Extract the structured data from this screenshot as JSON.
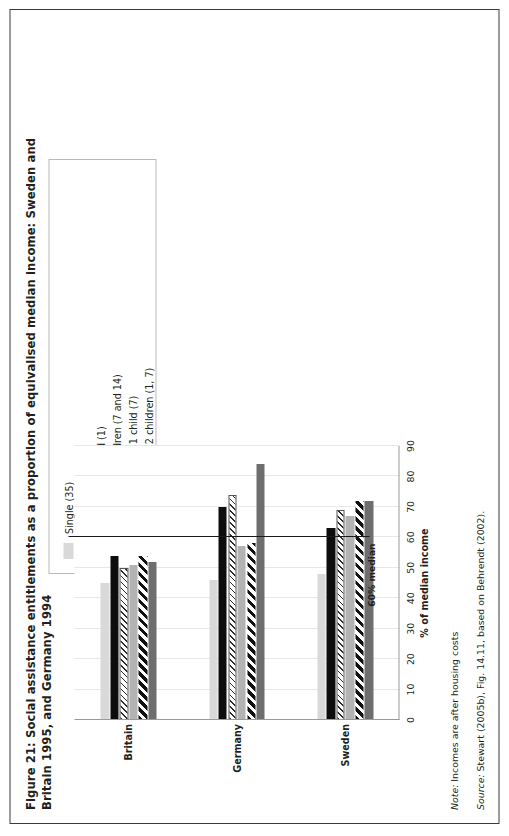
{
  "figure": {
    "title": "Figure 21: Social assistance entitlements as a proportion of equivalised median income: Sweden and Britain 1995, and Germany 1994",
    "note_lead": "Note:",
    "note_text": " Incomes are after housing costs",
    "source_lead": "Source:",
    "source_text": " Stewart (2005b), Fig. 14.11, based on Behrendt (2002).",
    "median_label": "60% median"
  },
  "legend": {
    "items": [
      {
        "label": "Single (35)",
        "swatch": "light-grey-swatch",
        "class": "sw-1"
      },
      {
        "label": "Couple (68)",
        "swatch": "black-swatch",
        "class": "sw-2"
      },
      {
        "label": "Couple (35) 1 child (1)",
        "swatch": "fine-hatch-swatch",
        "class": "sw-3"
      },
      {
        "label": "Couple (35) 2 children (7 and 14)",
        "swatch": "medium-grey-swatch",
        "class": "sw-4"
      },
      {
        "label": "Single parent (35) 1 child (7)",
        "swatch": "bold-diagonal-swatch",
        "class": "sw-5"
      },
      {
        "label": "Single parent (35) 2 children (1, 7)",
        "swatch": "dark-grey-swatch",
        "class": "sw-6"
      }
    ]
  },
  "chart_data": {
    "type": "bar",
    "orientation": "horizontal",
    "title": "Social assistance entitlements as a proportion of equivalised median income",
    "xlabel": "% of median income",
    "ylabel": "",
    "xlim": [
      0,
      90
    ],
    "xticks": [
      0,
      10,
      20,
      30,
      40,
      50,
      60,
      70,
      80,
      90
    ],
    "grid": true,
    "legend_position": "top-right",
    "categories": [
      "Britain",
      "Germany",
      "Sweden"
    ],
    "annotations": [
      {
        "label": "60% median",
        "value": 60,
        "type": "vertical-reference-line"
      }
    ],
    "series": [
      {
        "name": "Single (35)",
        "values": [
          45,
          46,
          48
        ]
      },
      {
        "name": "Couple (68)",
        "values": [
          54,
          70,
          63
        ]
      },
      {
        "name": "Couple (35) 1 child (1)",
        "values": [
          50,
          74,
          69
        ]
      },
      {
        "name": "Couple (35) 2 children (7 and 14)",
        "values": [
          51,
          57,
          67
        ]
      },
      {
        "name": "Single parent (35) 1 child (7)",
        "values": [
          54,
          58,
          72
        ]
      },
      {
        "name": "Single parent (35) 2 children (1, 7)",
        "values": [
          52,
          84,
          72
        ]
      }
    ]
  }
}
